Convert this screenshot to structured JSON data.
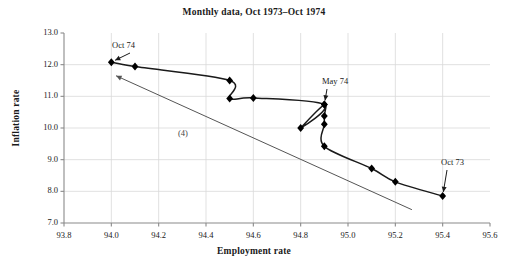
{
  "chart_data": {
    "type": "line",
    "title": "Monthly data, Oct 1973–Oct 1974",
    "xlabel": "Employment rate",
    "ylabel": "Inflation rate",
    "xlim": [
      93.8,
      95.6
    ],
    "ylim": [
      7.0,
      13.0
    ],
    "xticks": [
      "93.8",
      "94.0",
      "94.2",
      "94.4",
      "94.6",
      "94.8",
      "95.0",
      "95.2",
      "95.4",
      "95.6"
    ],
    "yticks": [
      "13.0",
      "12.0",
      "11.0",
      "10.0",
      "9.0",
      "8.0",
      "7.0"
    ],
    "grid": true,
    "legend": "none",
    "marker": "filled-diamond",
    "series": [
      {
        "name": "Monthly path Oct 1973 to Oct 1974",
        "x": [
          95.4,
          95.2,
          95.1,
          94.9,
          94.9,
          94.9,
          94.9,
          94.8,
          94.9,
          94.6,
          94.5,
          94.5,
          94.1,
          94.0
        ],
        "y": [
          7.85,
          8.3,
          8.72,
          9.42,
          10.12,
          10.38,
          10.74,
          10.0,
          10.74,
          10.95,
          10.93,
          11.5,
          11.94,
          12.08
        ]
      }
    ],
    "reference_line": {
      "label": "(4)",
      "x": [
        95.27,
        94.02
      ],
      "y": [
        7.42,
        11.65
      ],
      "arrow_at": "start-of-label-end"
    },
    "annotations": [
      {
        "text": "Oct 74",
        "target_x": 94.0,
        "target_y": 12.08
      },
      {
        "text": "May 74",
        "target_x": 94.9,
        "target_y": 10.74
      },
      {
        "text": "Oct 73",
        "target_x": 95.4,
        "target_y": 7.85
      }
    ]
  },
  "colors": {
    "line": "#1a1a1a",
    "marker": "#000000",
    "grid": "#d9d9d9",
    "axis": "#8a8a8a",
    "reference_line": "#555555",
    "text": "#1a1a1a"
  }
}
